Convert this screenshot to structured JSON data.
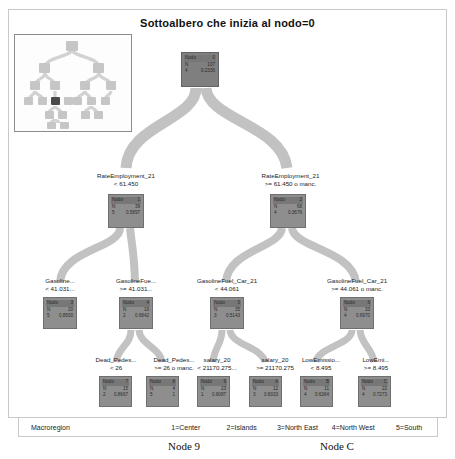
{
  "window": {
    "title": "Sottoalbero che inizia al nodo=0"
  },
  "thumbnail": {
    "name": "tree-overview-thumbnail",
    "highlighted_node_index": 2
  },
  "tree": {
    "nodes": [
      {
        "id": "root",
        "node_label": "Nodo",
        "node_id": "0",
        "n_label": "N",
        "n": "107",
        "cat_label": "4",
        "prob": "0.2336"
      },
      {
        "id": "n1",
        "node_label": "Nodo",
        "node_id": "1",
        "n_label": "N",
        "n": "39",
        "cat_label": "5",
        "prob": "0.5897"
      },
      {
        "id": "n2",
        "node_label": "Nodo",
        "node_id": "2",
        "n_label": "N",
        "n": "68",
        "cat_label": "4",
        "prob": "0.3676"
      },
      {
        "id": "n3",
        "node_label": "Nodo",
        "node_id": "3",
        "n_label": "N",
        "n": "20",
        "cat_label": "5",
        "prob": "0.8500"
      },
      {
        "id": "n4",
        "node_label": "Nodo",
        "node_id": "4",
        "n_label": "N",
        "n": "19",
        "cat_label": "2",
        "prob": "0.6842"
      },
      {
        "id": "n5",
        "node_label": "Nodo",
        "node_id": "5",
        "n_label": "N",
        "n": "35",
        "cat_label": "3",
        "prob": "0.5143"
      },
      {
        "id": "n6",
        "node_label": "Nodo",
        "node_id": "6",
        "n_label": "N",
        "n": "33",
        "cat_label": "4",
        "prob": "0.6970"
      },
      {
        "id": "n7",
        "node_label": "Nodo",
        "node_id": "7",
        "n_label": "N",
        "n": "15",
        "cat_label": "2",
        "prob": "0.8667"
      },
      {
        "id": "n8",
        "node_label": "Nodo",
        "node_id": "8",
        "n_label": "N",
        "n": "4",
        "cat_label": "5",
        "prob": "1"
      },
      {
        "id": "n9",
        "node_label": "Nodo",
        "node_id": "9",
        "n_label": "N",
        "n": "23",
        "cat_label": "1",
        "prob": "0.6087"
      },
      {
        "id": "nA",
        "node_label": "Nodo",
        "node_id": "A",
        "n_label": "N",
        "n": "12",
        "cat_label": "3",
        "prob": "0.8333"
      },
      {
        "id": "nB",
        "node_label": "Nodo",
        "node_id": "B",
        "n_label": "N",
        "n": "11",
        "cat_label": "4",
        "prob": "0.6364"
      },
      {
        "id": "nC",
        "node_label": "Nodo",
        "node_id": "C",
        "n_label": "N",
        "n": "22",
        "cat_label": "4",
        "prob": "0.7273"
      }
    ],
    "splits": [
      {
        "id": "s1",
        "variable": "RateEmployment_21",
        "condition": "< 61.450"
      },
      {
        "id": "s2",
        "variable": "RateEmployment_21",
        "condition": ">= 61.450 o manc."
      },
      {
        "id": "s3",
        "variable": "Gasoline...",
        "condition": "< 41.031..."
      },
      {
        "id": "s4",
        "variable": "GasolineFue...",
        "condition": ">= 41.031..."
      },
      {
        "id": "s5",
        "variable": "GasolineFuel_Car_21",
        "condition": "< 44.061"
      },
      {
        "id": "s6",
        "variable": "GasolineFuel_Car_21",
        "condition": ">= 44.061 o manc."
      },
      {
        "id": "s7",
        "variable": "Dead_Pedes...",
        "condition": "< 26"
      },
      {
        "id": "s8",
        "variable": "Dead_Pedes...",
        "condition": ">= 26 o manc."
      },
      {
        "id": "s9",
        "variable": "salary_20",
        "condition": "< 21170.275..."
      },
      {
        "id": "sA",
        "variable": "salary_20",
        "condition": ">= 21170.275"
      },
      {
        "id": "sB",
        "variable": "LowEmissio...",
        "condition": "< 8.495"
      },
      {
        "id": "sC",
        "variable": "LowEmi...",
        "condition": ">= 8.495"
      }
    ]
  },
  "legend": {
    "title": "Macroregion",
    "items": [
      "1=Center",
      "2=Islands",
      "3=North East",
      "4=North West",
      "5=South"
    ]
  },
  "captions": {
    "left": "Node 9",
    "right": "Node C"
  },
  "colors": {
    "node_fill": "#8e8e8e",
    "node_header": "#777777",
    "branch": "#bfbfbf",
    "frame_border": "#c9c9c9",
    "text": "#1a1a1a"
  }
}
